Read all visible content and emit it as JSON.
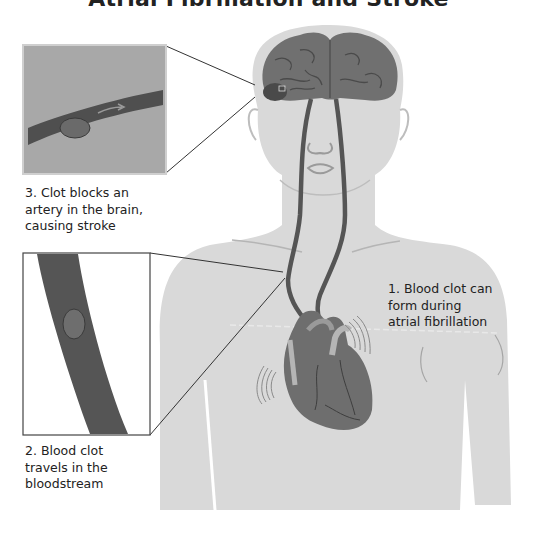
{
  "title": "Atrial Fibrillation and Stroke",
  "labels": {
    "step1": "1. Blood clot can\nform during\natrial fibrillation",
    "step2": "2. Blood clot\ntravels in the\nbloodstream",
    "step3": "3. Clot blocks an\nartery in the brain,\ncausing stroke"
  },
  "colors": {
    "body": "#d9d9d9",
    "brain": "#707070",
    "vessel": "#555555",
    "heart": "#6e6e6e",
    "inset_bg": "#a8a8a8",
    "text": "#222222"
  },
  "insets": [
    {
      "name": "brain-artery-inset",
      "position": "top-left"
    },
    {
      "name": "bloodstream-inset",
      "position": "middle-left"
    }
  ]
}
